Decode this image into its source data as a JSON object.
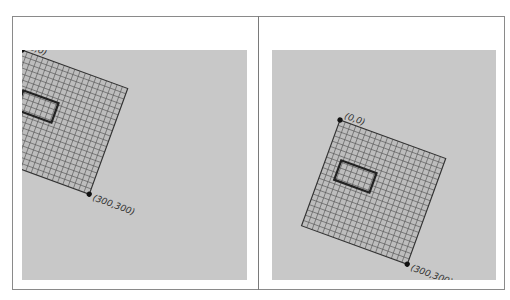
{
  "panels": [
    {
      "code_lines": [
        "rotate(radians(20));"
      ],
      "labels": {
        "origin": "(0,0)",
        "corner": "(300,300)"
      },
      "transform": {
        "translate": [
          0,
          0
        ],
        "rotate_deg": 20
      }
    },
    {
      "code_lines": [
        "translate(200,200);",
        "rotate(radians(20));"
      ],
      "labels": {
        "origin": "(0,0)",
        "corner": "(300,300)"
      },
      "transform": {
        "translate": [
          200,
          200
        ],
        "rotate_deg": 20
      }
    }
  ],
  "grid": {
    "size": 300,
    "cells": 20,
    "rect": [
      40,
      100,
      100,
      55
    ]
  },
  "colors": {
    "canvas": "#c8c8c8",
    "grid_fill": "#bdbdbd",
    "grid_line": "#555555",
    "outline": "#222222"
  }
}
